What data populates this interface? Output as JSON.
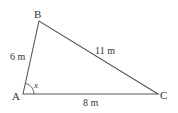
{
  "diagram": {
    "type": "triangle",
    "vertices": [
      {
        "label": "A",
        "x": 23,
        "y": 94
      },
      {
        "label": "B",
        "x": 39,
        "y": 21
      },
      {
        "label": "C",
        "x": 158,
        "y": 94
      }
    ],
    "sides": {
      "AB": "6 m",
      "BC": "11 m",
      "AC": "8 m"
    },
    "angle": {
      "vertex": "A",
      "label": "x"
    },
    "stroke_color": "#555555"
  }
}
